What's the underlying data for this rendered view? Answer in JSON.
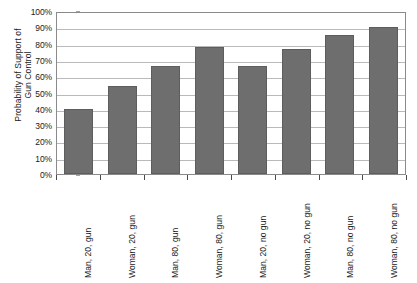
{
  "chart_data": {
    "type": "bar",
    "title": "",
    "xlabel": "",
    "ylabel": "Probability of Support of\nGun Control",
    "ylim": [
      0,
      100
    ],
    "yticks": [
      "0%",
      "10%",
      "20%",
      "30%",
      "40%",
      "50%",
      "60%",
      "70%",
      "80%",
      "90%",
      "100%"
    ],
    "ytick_values": [
      0,
      10,
      20,
      30,
      40,
      50,
      60,
      70,
      80,
      90,
      100
    ],
    "grid": true,
    "legend": false,
    "categories": [
      "Man, 20, gun",
      "Woman, 20, gun",
      "Man, 80, gun",
      "Woman, 80, gun",
      "Man, 20, no gun",
      "Woman, 20, no gun",
      "Man, 80, no gun",
      "Woman, 80, no gun"
    ],
    "values": [
      40,
      54,
      66,
      78,
      66,
      77,
      85,
      90
    ],
    "bar_color": "#6e6e6e",
    "axis_color": "#8a8a8a",
    "gridline_color": "#b9b9b9"
  }
}
